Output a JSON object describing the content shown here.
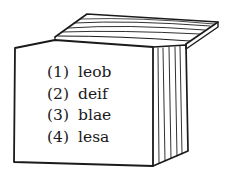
{
  "figure": {
    "stroke_color": "#1a1a1a",
    "background": "#ffffff"
  },
  "options": [
    {
      "number": "(1)",
      "text": "leob"
    },
    {
      "number": "(2)",
      "text": "deif"
    },
    {
      "number": "(3)",
      "text": "blae"
    },
    {
      "number": "(4)",
      "text": "lesa"
    }
  ]
}
